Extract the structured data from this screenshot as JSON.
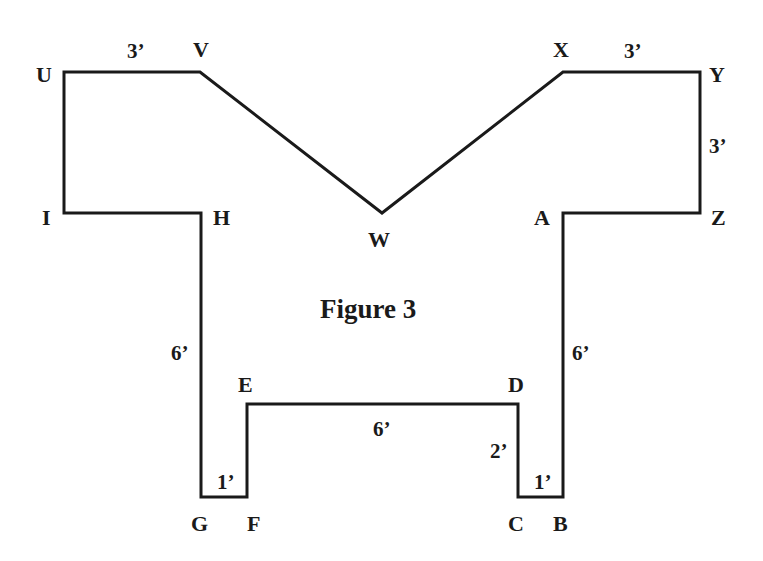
{
  "figure": {
    "title": "Figure 3",
    "stroke_color": "#1a1a1a",
    "vertices": [
      {
        "id": "U",
        "x": 64,
        "y": 72
      },
      {
        "id": "V",
        "x": 200,
        "y": 72
      },
      {
        "id": "W",
        "x": 382,
        "y": 213
      },
      {
        "id": "X",
        "x": 563,
        "y": 72
      },
      {
        "id": "Y",
        "x": 700,
        "y": 72
      },
      {
        "id": "Z",
        "x": 700,
        "y": 213
      },
      {
        "id": "A",
        "x": 563,
        "y": 213
      },
      {
        "id": "B",
        "x": 563,
        "y": 497
      },
      {
        "id": "C",
        "x": 518,
        "y": 497
      },
      {
        "id": "D",
        "x": 518,
        "y": 404
      },
      {
        "id": "E",
        "x": 247,
        "y": 404
      },
      {
        "id": "F",
        "x": 247,
        "y": 497
      },
      {
        "id": "G",
        "x": 201,
        "y": 497
      },
      {
        "id": "H",
        "x": 201,
        "y": 213
      },
      {
        "id": "I",
        "x": 64,
        "y": 213
      }
    ],
    "vertex_labels": {
      "U": "U",
      "V": "V",
      "W": "W",
      "X": "X",
      "Y": "Y",
      "Z": "Z",
      "A": "A",
      "B": "B",
      "C": "C",
      "D": "D",
      "E": "E",
      "F": "F",
      "G": "G",
      "H": "H",
      "I": "I"
    },
    "dimensions": {
      "uv": "3’",
      "xy": "3’",
      "yz": "3’",
      "gh": "6’",
      "ab": "6’",
      "ed": "6’",
      "cd": "2’",
      "gf": "1’",
      "cb": "1’"
    }
  }
}
